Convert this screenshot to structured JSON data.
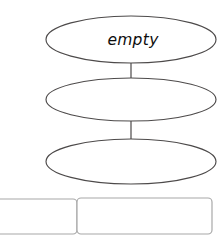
{
  "canvas": {
    "width": 224,
    "height": 242,
    "background_color": "#ffffff"
  },
  "diagram": {
    "type": "flowchart-vertical-chain",
    "stroke_color": "#4d4a4a",
    "connector_color": "#5a5757",
    "panel_stroke_color": "#a8a8a8",
    "text_color": "#0d0d0d",
    "nodes": [
      {
        "id": "node-1",
        "shape": "ellipse",
        "label": "empty",
        "cx": 131,
        "cy": 39.5,
        "rx": 85,
        "ry": 23.5,
        "label_x": 133,
        "label_y": 45
      },
      {
        "id": "node-2",
        "shape": "ellipse",
        "label": "",
        "cx": 131,
        "cy": 99.5,
        "rx": 85,
        "ry": 21.5,
        "label_x": 131,
        "label_y": 105
      },
      {
        "id": "node-3",
        "shape": "ellipse",
        "label": "",
        "cx": 131,
        "cy": 161.5,
        "rx": 85,
        "ry": 22.5,
        "label_x": 131,
        "label_y": 167
      }
    ],
    "connectors": [
      {
        "id": "connector-1-2",
        "x": 131,
        "y1": 62,
        "y2": 79
      },
      {
        "id": "connector-2-3",
        "x": 131,
        "y1": 121,
        "y2": 139
      }
    ],
    "panels": [
      {
        "id": "panel-left",
        "shape": "rounded-rect",
        "label": "",
        "x": -10,
        "y": 199,
        "width": 87,
        "height": 35,
        "radius": 4
      },
      {
        "id": "panel-right",
        "shape": "rounded-rect",
        "label": "",
        "x": 77,
        "y": 198,
        "width": 135,
        "height": 36,
        "radius": 4
      }
    ]
  }
}
